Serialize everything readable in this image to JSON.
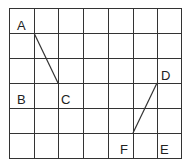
{
  "diagram": {
    "type": "grid-with-segments",
    "grid": {
      "columns": 7,
      "rows": 6,
      "line_color": "#333333"
    },
    "labels": [
      {
        "id": "A",
        "text": "A"
      },
      {
        "id": "B",
        "text": "B"
      },
      {
        "id": "C",
        "text": "C"
      },
      {
        "id": "D",
        "text": "D"
      },
      {
        "id": "E",
        "text": "E"
      },
      {
        "id": "F",
        "text": "F"
      }
    ],
    "segments": [
      {
        "from": "A",
        "to": "C"
      },
      {
        "from": "D",
        "to": "F"
      }
    ]
  }
}
